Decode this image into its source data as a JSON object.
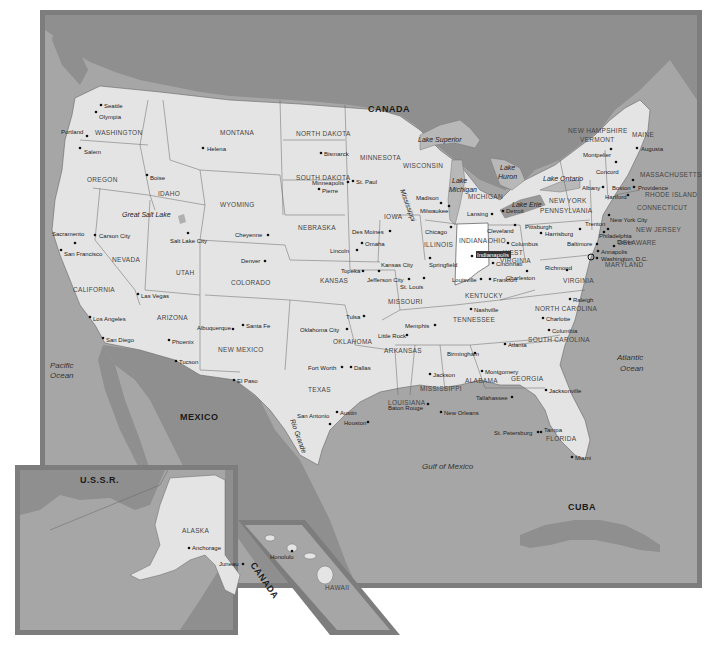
{
  "map": {
    "title": "United States",
    "highlighted_state": "INDIANA",
    "highlighted_city": "Indianapolis",
    "colors": {
      "land_us": "#e4e4e4",
      "land_foreign": "#8f8f8f",
      "water": "#a6a6a6",
      "frame": "#7d7d7d",
      "highlight": "#ffffff",
      "lakes": "#b8b8b8",
      "border": "#555555"
    },
    "countries": {
      "canada": "CANADA",
      "mexico": "MEXICO",
      "cuba": "CUBA",
      "ussr": "U.S.S.R.",
      "canada_inset": "CANADA"
    },
    "water_bodies": {
      "pacific_1": "Pacific",
      "pacific_2": "Ocean",
      "atlantic_1": "Atlantic",
      "atlantic_2": "Ocean",
      "gulf": "Gulf of Mexico",
      "great_salt_lake": "Great Salt Lake",
      "lake_superior": "Lake Superior",
      "lake_michigan_1": "Lake",
      "lake_michigan_2": "Michigan",
      "lake_huron_1": "Lake",
      "lake_huron_2": "Huron",
      "lake_erie": "Lake Erie",
      "lake_ontario": "Lake Ontario",
      "rio_grande": "Rio Grande",
      "mississippi": "Mississippi"
    },
    "states": {
      "washington": "WASHINGTON",
      "oregon": "OREGON",
      "california": "CALIFORNIA",
      "idaho": "IDAHO",
      "nevada": "NEVADA",
      "montana": "MONTANA",
      "wyoming": "WYOMING",
      "utah": "UTAH",
      "arizona": "ARIZONA",
      "colorado": "COLORADO",
      "new_mexico": "NEW MEXICO",
      "north_dakota": "NORTH DAKOTA",
      "south_dakota": "SOUTH DAKOTA",
      "nebraska": "NEBRASKA",
      "kansas": "KANSAS",
      "oklahoma": "OKLAHOMA",
      "texas": "TEXAS",
      "minnesota": "MINNESOTA",
      "iowa": "IOWA",
      "missouri": "MISSOURI",
      "arkansas": "ARKANSAS",
      "louisiana": "LOUISIANA",
      "wisconsin": "WISCONSIN",
      "illinois": "ILLINOIS",
      "michigan": "MICHIGAN",
      "indiana": "INDIANA",
      "ohio": "OHIO",
      "kentucky": "KENTUCKY",
      "tennessee": "TENNESSEE",
      "mississippi": "MISSISSIPPI",
      "alabama": "ALABAMA",
      "georgia": "GEORGIA",
      "florida": "FLORIDA",
      "south_carolina": "SOUTH CAROLINA",
      "north_carolina": "NORTH CAROLINA",
      "virginia": "VIRGINIA",
      "west_virginia_1": "WEST",
      "west_virginia_2": "VIRGINIA",
      "pennsylvania": "PENNSYLVANIA",
      "new_york": "NEW YORK",
      "vermont": "VERMONT",
      "new_hampshire": "NEW HAMPSHIRE",
      "maine": "MAINE",
      "massachusetts": "MASSACHUSETTS",
      "rhode_island": "RHODE ISLAND",
      "connecticut": "CONNECTICUT",
      "new_jersey": "NEW JERSEY",
      "delaware": "DELAWARE",
      "maryland": "MARYLAND",
      "alaska": "ALASKA",
      "hawaii": "HAWAII"
    },
    "cities": {
      "seattle": "Seattle",
      "olympia": "Olympia",
      "portland": "Portland",
      "salem": "Salem",
      "boise": "Boise",
      "helena": "Helena",
      "sacramento": "Sacramento",
      "san_francisco": "San Francisco",
      "carson_city": "Carson City",
      "salt_lake_city": "Salt Lake City",
      "las_vegas": "Las Vegas",
      "los_angeles": "Los Angeles",
      "san_diego": "San Diego",
      "phoenix": "Phoenix",
      "tucson": "Tucson",
      "cheyenne": "Cheyenne",
      "denver": "Denver",
      "albuquerque": "Albuquerque",
      "santa_fe": "Santa Fe",
      "el_paso": "El Paso",
      "bismarck": "Bismarck",
      "pierre": "Pierre",
      "lincoln": "Lincoln",
      "omaha": "Omaha",
      "topeka": "Topeka",
      "kansas_city": "Kansas City",
      "jefferson_city": "Jefferson City",
      "st_louis": "St. Louis",
      "tulsa": "Tulsa",
      "oklahoma_city": "Oklahoma City",
      "fort_worth": "Fort Worth",
      "dallas": "Dallas",
      "austin": "Austin",
      "san_antonio": "San Antonio",
      "houston": "Houston",
      "minneapolis": "Minneapolis",
      "st_paul": "St. Paul",
      "des_moines": "Des Moines",
      "madison": "Madison",
      "milwaukee": "Milwaukee",
      "chicago": "Chicago",
      "springfield": "Springfield",
      "lansing": "Lansing",
      "detroit": "Detroit",
      "indianapolis": "Indianapolis",
      "cleveland": "Cleveland",
      "columbus": "Columbus",
      "cincinnati": "Cincinnati",
      "louisville": "Louisville",
      "frankfort": "Frankfort",
      "little_rock": "Little Rock",
      "memphis": "Memphis",
      "nashville": "Nashville",
      "baton_rouge": "Baton Rouge",
      "new_orleans": "New Orleans",
      "jackson": "Jackson",
      "birmingham": "Birmingham",
      "montgomery": "Montgomery",
      "atlanta": "Atlanta",
      "tallahassee": "Tallahassee",
      "jacksonville": "Jacksonville",
      "st_petersburg": "St. Petersburg",
      "tampa": "Tampa",
      "miami": "Miami",
      "columbia": "Columbia",
      "charlotte": "Charlotte",
      "raleigh": "Raleigh",
      "richmond": "Richmond",
      "charleston": "Charleston",
      "pittsburgh": "Pittsburgh",
      "harrisburg": "Harrisburg",
      "baltimore": "Baltimore",
      "annapolis": "Annapolis",
      "washington_dc": "Washington, D.C.",
      "dover": "Dover",
      "philadelphia": "Philadelphia",
      "trenton": "Trenton",
      "new_york_city": "New York City",
      "hartford": "Hartford",
      "providence": "Providence",
      "boston": "Boston",
      "albany": "Albany",
      "concord": "Concord",
      "montpelier": "Montpelier",
      "augusta": "Augusta",
      "anchorage": "Anchorage",
      "juneau": "Juneau",
      "honolulu": "Honolulu"
    }
  }
}
